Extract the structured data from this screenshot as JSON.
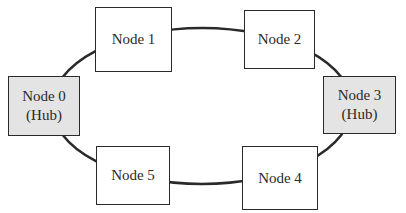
{
  "diagram": {
    "type": "ring-topology",
    "colors": {
      "hub_fill": "#e4e4e4",
      "node_fill": "#ffffff",
      "stroke": "#2a2a2a"
    },
    "nodes": [
      {
        "id": "0",
        "label": "Node 0",
        "sublabel": "(Hub)",
        "hub": true
      },
      {
        "id": "1",
        "label": "Node 1",
        "hub": false
      },
      {
        "id": "2",
        "label": "Node 2",
        "hub": false
      },
      {
        "id": "3",
        "label": "Node 3",
        "sublabel": "(Hub)",
        "hub": true
      },
      {
        "id": "4",
        "label": "Node 4",
        "hub": false
      },
      {
        "id": "5",
        "label": "Node 5",
        "hub": false
      }
    ],
    "edges": [
      [
        "0",
        "1"
      ],
      [
        "1",
        "2"
      ],
      [
        "2",
        "3"
      ],
      [
        "3",
        "4"
      ],
      [
        "4",
        "5"
      ],
      [
        "5",
        "0"
      ]
    ]
  }
}
